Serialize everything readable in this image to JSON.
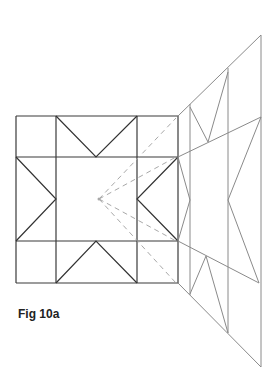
{
  "caption": "Fig 10a",
  "colors": {
    "block_outline": "#3a3a3a",
    "block_inner": "#333333",
    "perspective_wall": "#8a8a8a",
    "sight_lines": "#a8a8a8",
    "background": "#ffffff"
  },
  "quilt_block": {
    "grid_x": [
      16,
      56,
      137,
      178
    ],
    "grid_y": [
      116,
      157,
      241,
      283
    ],
    "triangles": [
      {
        "name": "top-v",
        "points": [
          [
            56,
            116
          ],
          [
            96,
            157
          ],
          [
            137,
            116
          ]
        ]
      },
      {
        "name": "left-arrow",
        "points": [
          [
            16,
            157
          ],
          [
            56,
            199
          ],
          [
            16,
            241
          ]
        ]
      },
      {
        "name": "right-arrow",
        "points": [
          [
            178,
            157
          ],
          [
            137,
            199
          ],
          [
            178,
            241
          ]
        ]
      },
      {
        "name": "bottom-v",
        "points": [
          [
            56,
            283
          ],
          [
            96,
            241
          ],
          [
            137,
            283
          ]
        ]
      }
    ]
  },
  "vanishing_point": [
    99,
    199
  ],
  "sight_lines": [
    [
      176,
      118
    ],
    [
      176,
      157
    ],
    [
      176,
      241
    ],
    [
      176,
      283
    ]
  ],
  "perspective_wall": {
    "outline": [
      [
        178,
        116
      ],
      [
        261,
        35
      ],
      [
        261,
        367
      ],
      [
        178,
        283
      ]
    ],
    "verticals": [
      {
        "x": 190,
        "y1": 104,
        "y2": 295
      },
      {
        "x": 228,
        "y1": 68,
        "y2": 333
      }
    ],
    "horizontals": [
      [
        [
          178,
          157
        ],
        [
          261,
          117
        ]
      ],
      [
        [
          178,
          241
        ],
        [
          259,
          283
        ]
      ]
    ],
    "folds": [
      [
        [
          190,
          107
        ],
        [
          208,
          142
        ],
        [
          228,
          72
        ]
      ],
      [
        [
          178,
          157
        ],
        [
          190,
          200
        ],
        [
          178,
          241
        ]
      ],
      [
        [
          261,
          117
        ],
        [
          228,
          200
        ],
        [
          259,
          283
        ]
      ],
      [
        [
          190,
          294
        ],
        [
          206,
          256
        ],
        [
          228,
          333
        ]
      ]
    ]
  }
}
